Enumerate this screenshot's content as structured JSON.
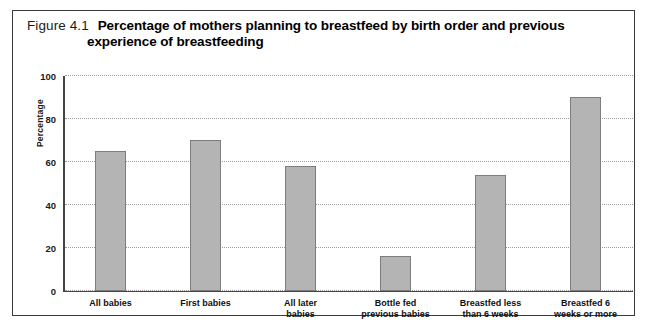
{
  "figure": {
    "number": "Figure 4.1",
    "title_line1": "Percentage of mothers planning to breastfeed by birth order and previous",
    "title_line2": "experience of breastfeeding"
  },
  "colors": {
    "bar_fill": "#b4b4b4",
    "bar_border": "#7d7d7d",
    "axis": "#444444",
    "gridline": "#9a9a9a",
    "frame": "#3a3a3a"
  },
  "chart_data": {
    "type": "bar",
    "title": "Percentage of mothers planning to breastfeed by birth order and previous experience of breastfeeding",
    "xlabel": "",
    "ylabel": "Percentage",
    "ylim": [
      0,
      100
    ],
    "yticks": [
      0,
      20,
      40,
      60,
      80,
      100
    ],
    "grid": true,
    "legend": false,
    "categories": [
      "All babies",
      "First babies",
      "All later\nbabies",
      "Bottle fed\nprevious babies",
      "Breastfed less\nthan 6 weeks",
      "Breastfed 6\nweeks or more"
    ],
    "values": [
      65,
      70,
      58,
      16,
      54,
      90
    ]
  }
}
